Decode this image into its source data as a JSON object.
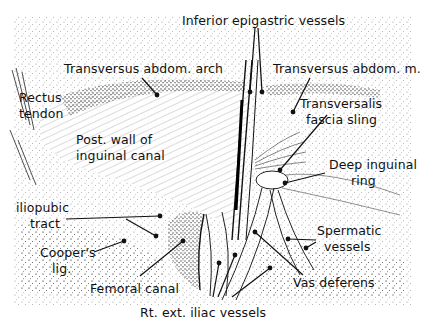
{
  "figure": {
    "background": "#ffffff",
    "ink": "#111111",
    "labels": [
      {
        "id": "inferior-epigastric-vessels",
        "text": "Inferior epigastric vessels",
        "x": 182,
        "y": 14
      },
      {
        "id": "transversus-abdom-arch",
        "text": "Transversus abdom. arch",
        "x": 64,
        "y": 62
      },
      {
        "id": "transversus-abdom-m",
        "text": "Transversus abdom. m.",
        "x": 273,
        "y": 62
      },
      {
        "id": "rectus-tendon-line1",
        "text": "Rectus",
        "x": 19,
        "y": 91
      },
      {
        "id": "rectus-tendon-line2",
        "text": "tendon",
        "x": 19,
        "y": 107
      },
      {
        "id": "transversalis-fascia-sling-line1",
        "text": "Transversalis",
        "x": 300,
        "y": 97
      },
      {
        "id": "transversalis-fascia-sling-line2",
        "text": "fascia sling",
        "x": 306,
        "y": 113
      },
      {
        "id": "post-wall-line1",
        "text": "Post. wall of",
        "x": 76,
        "y": 133
      },
      {
        "id": "post-wall-line2",
        "text": "inguinal canal",
        "x": 76,
        "y": 149
      },
      {
        "id": "deep-inguinal-ring-line1",
        "text": "Deep inguinal",
        "x": 329,
        "y": 158
      },
      {
        "id": "deep-inguinal-ring-line2",
        "text": "ring",
        "x": 351,
        "y": 174
      },
      {
        "id": "iliopubic-tract-line1",
        "text": "iliopubic",
        "x": 16,
        "y": 201
      },
      {
        "id": "iliopubic-tract-line2",
        "text": "tract",
        "x": 30,
        "y": 217
      },
      {
        "id": "spermatic-vessels-line1",
        "text": "Spermatic",
        "x": 317,
        "y": 224
      },
      {
        "id": "spermatic-vessels-line2",
        "text": "vessels",
        "x": 324,
        "y": 240
      },
      {
        "id": "coopers-lig-line1",
        "text": "Cooper's",
        "x": 40,
        "y": 246
      },
      {
        "id": "coopers-lig-line2",
        "text": "lig.",
        "x": 52,
        "y": 262
      },
      {
        "id": "vas-deferens",
        "text": "Vas deferens",
        "x": 293,
        "y": 276
      },
      {
        "id": "femoral-canal",
        "text": "Femoral canal",
        "x": 90,
        "y": 282
      },
      {
        "id": "rt-ext-iliac-vessels",
        "text": "Rt. ext. iliac vessels",
        "x": 140,
        "y": 306
      }
    ],
    "leaders": [
      {
        "for": "inferior-epigastric-vessels",
        "x1": 255,
        "y1": 28,
        "x2": 250,
        "y2": 92
      },
      {
        "for": "inferior-epigastric-vessels",
        "x1": 258,
        "y1": 28,
        "x2": 262,
        "y2": 92
      },
      {
        "for": "transversus-abdom-arch",
        "x1": 142,
        "y1": 78,
        "x2": 157,
        "y2": 95
      },
      {
        "for": "transversus-abdom-m",
        "x1": 310,
        "y1": 78,
        "x2": 293,
        "y2": 112
      },
      {
        "for": "transversalis-fascia-sling",
        "x1": 327,
        "y1": 115,
        "x2": 280,
        "y2": 170
      },
      {
        "for": "deep-inguinal-ring",
        "x1": 325,
        "y1": 173,
        "x2": 285,
        "y2": 183
      },
      {
        "for": "iliopubic-tract",
        "x1": 66,
        "y1": 219,
        "x2": 160,
        "y2": 216
      },
      {
        "for": "iliopubic-tract",
        "x1": 126,
        "y1": 219,
        "x2": 156,
        "y2": 236
      },
      {
        "for": "coopers-lig",
        "x1": 94,
        "y1": 252,
        "x2": 124,
        "y2": 241
      },
      {
        "for": "femoral-canal",
        "x1": 140,
        "y1": 276,
        "x2": 183,
        "y2": 241
      },
      {
        "for": "spermatic-vessels",
        "x1": 316,
        "y1": 240,
        "x2": 288,
        "y2": 239
      },
      {
        "for": "spermatic-vessels",
        "x1": 316,
        "y1": 242,
        "x2": 306,
        "y2": 248
      },
      {
        "for": "vas-deferens",
        "x1": 303,
        "y1": 275,
        "x2": 255,
        "y2": 232
      },
      {
        "for": "rt-ext-iliac-vessels",
        "x1": 213,
        "y1": 297,
        "x2": 219,
        "y2": 263
      },
      {
        "for": "rt-ext-iliac-vessels",
        "x1": 218,
        "y1": 297,
        "x2": 235,
        "y2": 255
      },
      {
        "for": "rt-ext-iliac-vessels",
        "x1": 232,
        "y1": 297,
        "x2": 270,
        "y2": 268
      }
    ]
  }
}
